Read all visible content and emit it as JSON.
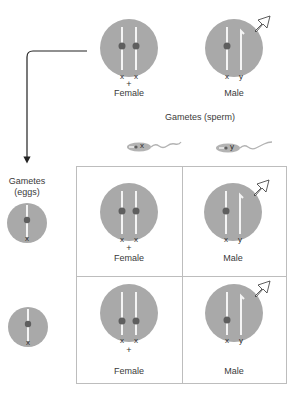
{
  "colors": {
    "cell_fill": "#a9a9a9",
    "centromere": "#5e5e5e",
    "chromosome": "#f4f4f4",
    "grid_line": "#bdbdbd",
    "arrow_line": "#222222"
  },
  "parents": {
    "female": {
      "label": "Female",
      "symbol": "+",
      "chromosomes": [
        "x",
        "x"
      ]
    },
    "male": {
      "label": "Male",
      "chromosomes": [
        "x",
        "y"
      ]
    }
  },
  "gametes_sperm": {
    "label": "Gametes (sperm)",
    "items": [
      {
        "chromosome": "x"
      },
      {
        "chromosome": "y"
      }
    ]
  },
  "gametes_eggs": {
    "label_line1": "Gametes",
    "label_line2": "(eggs)",
    "items": [
      {
        "chromosome": "x"
      },
      {
        "chromosome": "x"
      }
    ]
  },
  "punnett": {
    "cells": [
      {
        "label": "Female",
        "symbol": "+",
        "chromosomes": [
          "x",
          "x"
        ]
      },
      {
        "label": "Male",
        "chromosomes": [
          "x",
          "y"
        ]
      },
      {
        "label": "Female",
        "symbol": "+",
        "chromosomes": [
          "x",
          "x"
        ]
      },
      {
        "label": "Male",
        "chromosomes": [
          "x",
          "y"
        ]
      }
    ]
  }
}
